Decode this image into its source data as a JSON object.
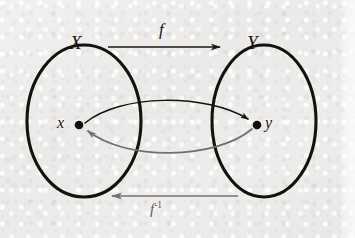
{
  "figure": {
    "kind": "set-mapping-diagram",
    "background_color": "#edecea",
    "ink_color": "#14120f",
    "inverse_ink_color": "#6f6f6d"
  },
  "sets": [
    {
      "id": "domain",
      "label": "X",
      "label_name": "set-label-x",
      "cx": 84,
      "cy": 121,
      "rx": 57,
      "ry": 76
    },
    {
      "id": "codomain",
      "label": "Y",
      "label_name": "set-label-y",
      "cx": 264,
      "cy": 121,
      "rx": 52,
      "ry": 76
    }
  ],
  "points": [
    {
      "id": "element-x",
      "label": "x",
      "x": 79,
      "y": 125,
      "in_set": "X"
    },
    {
      "id": "element-y",
      "label": "y",
      "x": 257,
      "y": 125,
      "in_set": "Y"
    }
  ],
  "maps": [
    {
      "id": "forward-map",
      "label": "f",
      "direction": "left-to-right",
      "from": "X",
      "to": "Y",
      "color": "#1a1714",
      "arrow_y": 47,
      "arrow_x_start": 108,
      "arrow_x_end": 224
    },
    {
      "id": "inverse-map",
      "label_base": "f",
      "label_exponent": "-1",
      "direction": "right-to-left",
      "from": "Y",
      "to": "X",
      "color": "#737371",
      "arrow_y": 196,
      "arrow_x_start": 238,
      "arrow_x_end": 108
    }
  ],
  "element_arcs": [
    {
      "id": "forward-element-arc",
      "from_point": "x",
      "to_point": "y",
      "bulge": "upward",
      "color": "#15130f"
    },
    {
      "id": "inverse-element-arc",
      "from_point": "y",
      "to_point": "x",
      "bulge": "downward",
      "color": "#6f6f6d"
    }
  ]
}
